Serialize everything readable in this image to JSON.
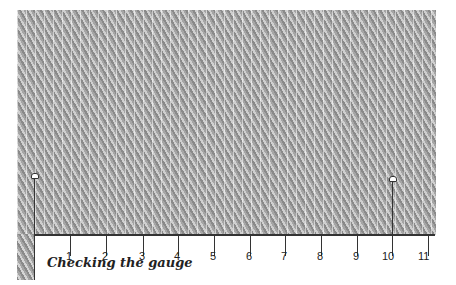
{
  "title": "Checking the gauge",
  "ruler": {
    "labels": [
      "1",
      "2",
      "3",
      "4",
      "5",
      "6",
      "7",
      "8",
      "9",
      "10",
      "11"
    ],
    "tick_x": [
      70,
      106,
      143,
      178,
      214,
      250,
      285,
      321,
      357,
      392,
      428
    ]
  },
  "pins": [
    {
      "name": "left-pin",
      "x": 34
    },
    {
      "name": "right-pin",
      "x": 392
    }
  ]
}
